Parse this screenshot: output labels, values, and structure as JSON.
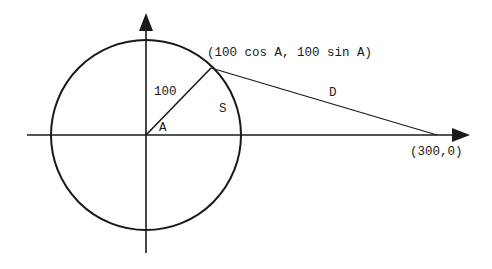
{
  "diagram": {
    "type": "geometry",
    "colors": {
      "ink": "#1a1a1a",
      "background": "#ffffff"
    },
    "labels": {
      "point_on_circle": "(100 cos A, 100 sin A)",
      "radius": "100",
      "angle": "A",
      "arc": "S",
      "distance": "D",
      "far_point": "(300,0)"
    },
    "geometry": {
      "center": [
        146,
        135
      ],
      "radius_px": 95,
      "angle_deg": 46,
      "point_on_circle_px": [
        211,
        68
      ],
      "far_point_px": [
        437,
        135
      ]
    }
  }
}
